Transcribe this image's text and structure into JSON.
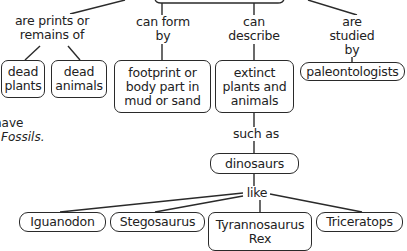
{
  "diagram": {
    "type": "concept-map",
    "root": {
      "label": ""
    },
    "branches": [
      {
        "link": "are prints or\nremains of",
        "children": [
          "dead\nplants",
          "dead\nanimals"
        ]
      },
      {
        "link": "can form\nby",
        "children": [
          "footprint or\nbody part in\nmud or sand"
        ]
      },
      {
        "link": "can\ndescribe",
        "children": [
          "extinct\nplants and\nanimals"
        ]
      },
      {
        "link": "are studied\nby",
        "children": [
          "paleontologists"
        ]
      }
    ],
    "sub_chain": {
      "link_such_as": "such as",
      "dinosaurs": "dinosaurs",
      "link_like": "like",
      "examples": [
        "Iguanodon",
        "Stegosaurus",
        "Tyrannosaurus\nRex",
        "Triceratops"
      ]
    },
    "side_note": {
      "line1": "have",
      "line2": "Fossils."
    }
  },
  "colors": {
    "stroke": "#2a2a2a",
    "text": "#222222",
    "background": "#ffffff"
  }
}
